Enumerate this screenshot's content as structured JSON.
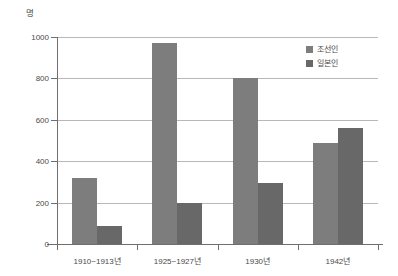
{
  "chart_data": {
    "type": "bar",
    "title": "",
    "unit_label": "명",
    "xlabel": "",
    "ylabel": "",
    "ylim": [
      0,
      1000
    ],
    "yticks": [
      0,
      200,
      400,
      600,
      800,
      1000
    ],
    "ytick_labels": [
      "0",
      "200",
      "400",
      "600",
      "800",
      "1000"
    ],
    "grid": true,
    "legend_position": "top-right",
    "categories": [
      "1910~1913년",
      "1925~1927년",
      "1930년",
      "1942년"
    ],
    "series": [
      {
        "name": "조선인",
        "color": "#7d7d7d",
        "values": [
          320,
          970,
          800,
          490
        ]
      },
      {
        "name": "일본인",
        "color": "#686868",
        "values": [
          85,
          200,
          295,
          560
        ]
      }
    ]
  }
}
